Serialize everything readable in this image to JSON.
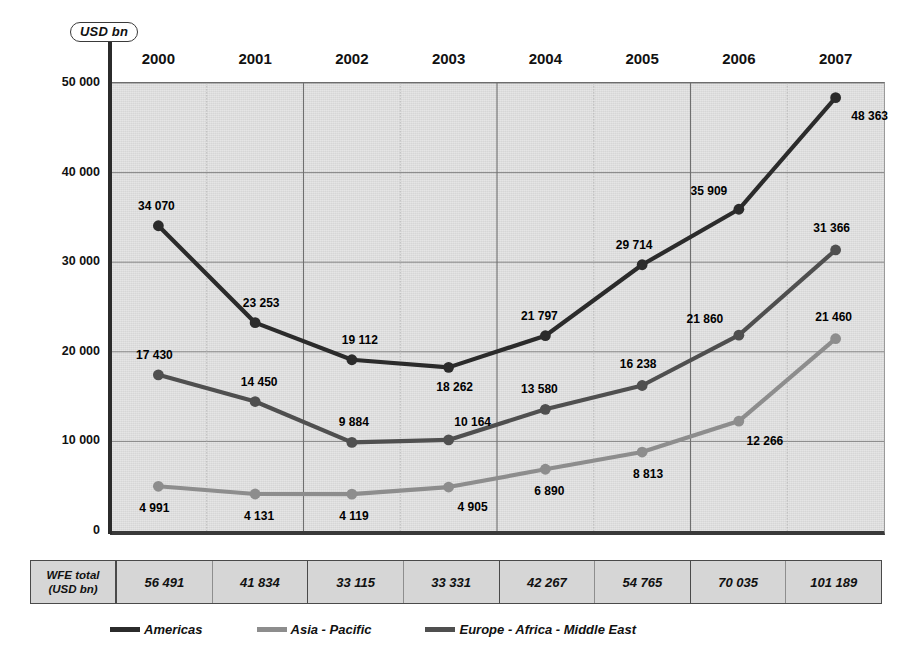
{
  "unit_badge": "USD bn",
  "chart_data": {
    "type": "line",
    "title": "",
    "subtitle": "",
    "xlabel": "",
    "ylabel": "USD bn",
    "categories": [
      "2000",
      "2001",
      "2002",
      "2003",
      "2004",
      "2005",
      "2006",
      "2007"
    ],
    "ylim": [
      0,
      50000
    ],
    "y_ticks": [
      "0",
      "10 000",
      "20 000",
      "30 000",
      "40 000",
      "50 000"
    ],
    "y_tick_values": [
      0,
      10000,
      20000,
      30000,
      40000,
      50000
    ],
    "grid": true,
    "legend_position": "bottom",
    "series": [
      {
        "name": "Americas",
        "color": "#2b2b2b",
        "values": [
          34070,
          23253,
          19112,
          18262,
          21797,
          29714,
          35909,
          48363
        ],
        "labels": [
          "34 070",
          "23 253",
          "19 112",
          "18 262",
          "21 797",
          "29 714",
          "35 909",
          "48 363"
        ]
      },
      {
        "name": "Europe - Africa - Middle East",
        "color": "#4f4f4f",
        "values": [
          17430,
          14450,
          9884,
          10164,
          13580,
          16238,
          21860,
          31366
        ],
        "labels": [
          "17 430",
          "14 450",
          "9 884",
          "10 164",
          "13 580",
          "16 238",
          "21 860",
          "31 366"
        ]
      },
      {
        "name": "Asia - Pacific",
        "color": "#8d8d8d",
        "values": [
          4991,
          4131,
          4119,
          4905,
          6890,
          8813,
          12266,
          21460
        ],
        "labels": [
          "4 991",
          "4 131",
          "4 119",
          "4 905",
          "6 890",
          "8 813",
          "12 266",
          "21 460"
        ]
      }
    ],
    "totals_row": {
      "header_line1": "WFE total",
      "header_line2": "(USD bn)",
      "values": [
        "56 491",
        "41 834",
        "33 115",
        "33 331",
        "42 267",
        "54 765",
        "70 035",
        "101 189"
      ]
    }
  },
  "legend": {
    "items": [
      {
        "label": "Americas",
        "color": "#2b2b2b"
      },
      {
        "label": "Asia - Pacific",
        "color": "#8d8d8d"
      },
      {
        "label": "Europe - Africa - Middle East",
        "color": "#4f4f4f"
      }
    ]
  }
}
